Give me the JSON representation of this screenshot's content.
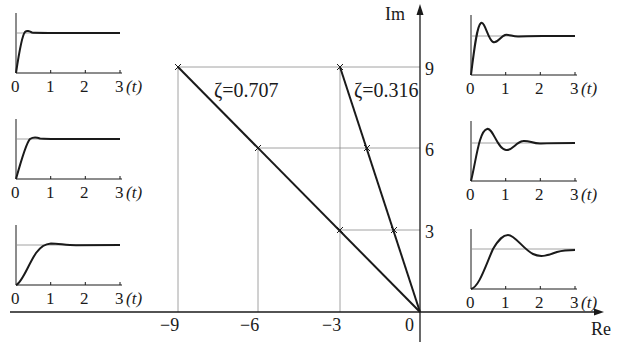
{
  "main_plot": {
    "title": "Pole locations and step responses",
    "axis_x_label": "Re",
    "axis_y_label": "Im",
    "x_ticks": [
      "-9",
      "-6",
      "-3",
      "0"
    ],
    "x_tick_labels": [
      "−9",
      "−6",
      "−3",
      "0"
    ],
    "y_ticks": [
      "3",
      "6",
      "9"
    ],
    "lines": [
      {
        "label": "ζ=0.707",
        "zeta": 0.707,
        "points": [
          [
            -9,
            9
          ],
          [
            -6,
            6
          ],
          [
            -3,
            3
          ]
        ]
      },
      {
        "label": "ζ=0.316",
        "zeta": 0.316,
        "points": [
          [
            -3,
            9
          ],
          [
            -2,
            6
          ],
          [
            -1,
            3
          ]
        ]
      }
    ]
  },
  "step_responses": {
    "time_axis_label": "(t)",
    "time_ticks": [
      "0",
      "1",
      "2",
      "3"
    ],
    "left_column": [
      {
        "pole": "-9±j9",
        "zeta": 0.707,
        "description": "fast, tiny overshoot"
      },
      {
        "pole": "-6±j6",
        "zeta": 0.707,
        "description": "medium, tiny overshoot"
      },
      {
        "pole": "-3±j3",
        "zeta": 0.707,
        "description": "slow, tiny overshoot"
      }
    ],
    "right_column": [
      {
        "pole": "-3±j9",
        "zeta": 0.316,
        "description": "fast oscillation, large overshoot"
      },
      {
        "pole": "-2±j6",
        "zeta": 0.316,
        "description": "medium oscillation, large overshoot"
      },
      {
        "pole": "-1±j3",
        "zeta": 0.316,
        "description": "slow oscillation, large overshoot"
      }
    ]
  },
  "labels": {
    "zeta1": "ζ=0.707",
    "zeta2": "ζ=0.316",
    "re": "Re",
    "im": "Im",
    "t": "(t)",
    "t0": "0",
    "t1": "1",
    "t2": "2",
    "t3": "3",
    "xm9": "−9",
    "xm6": "−6",
    "xm3": "−3",
    "x0": "0",
    "y3": "3",
    "y6": "6",
    "y9": "9"
  },
  "colors": {
    "line": "#1a1a1a",
    "grid": "#8a8a8a",
    "background": "#ffffff"
  }
}
